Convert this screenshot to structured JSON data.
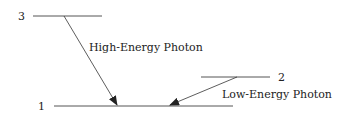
{
  "diagram": {
    "levels": [
      {
        "id": "level-3",
        "label": "3"
      },
      {
        "id": "level-2",
        "label": "2"
      },
      {
        "id": "level-1",
        "label": "1"
      }
    ],
    "transitions": [
      {
        "from": "3",
        "to": "1",
        "label": "High-Energy Photon"
      },
      {
        "from": "2",
        "to": "1",
        "label": "Low-Energy Photon"
      }
    ],
    "colors": {
      "line": "#333333",
      "text": "#222222",
      "background": "#ffffff"
    }
  }
}
